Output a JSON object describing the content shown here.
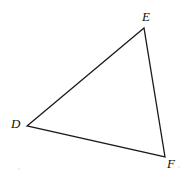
{
  "figure": {
    "kind": "geometry-diagram",
    "shape": "triangle",
    "name": "Triangle DEF",
    "canvas": {
      "width": 187,
      "height": 181
    },
    "background_color": "#ffffff",
    "stroke_color": "#1a1a1a",
    "stroke_width": 1.3,
    "fill": "none",
    "label_color": "#111111",
    "label_style": "italic-serif",
    "vertices": [
      {
        "id": "D",
        "label": "D",
        "x": 27,
        "y": 126,
        "label_x": 15,
        "label_y": 124,
        "label_position": "left"
      },
      {
        "id": "E",
        "label": "E",
        "x": 144,
        "y": 28,
        "label_x": 148,
        "label_y": 17,
        "label_position": "above-right"
      },
      {
        "id": "F",
        "label": "F",
        "x": 165,
        "y": 157,
        "label_x": 171,
        "label_y": 164,
        "label_position": "below-right"
      }
    ],
    "edges": [
      {
        "id": "DE",
        "from": "D",
        "to": "E"
      },
      {
        "id": "EF",
        "from": "E",
        "to": "F"
      },
      {
        "id": "FD",
        "from": "F",
        "to": "D"
      }
    ],
    "path_points": "27,126 144,28 165,157",
    "artifacts": [
      {
        "id": "speck-1",
        "x": 18,
        "y": 168,
        "size": 2
      },
      {
        "id": "speck-2",
        "x": 178,
        "y": 166,
        "size": 2
      }
    ]
  }
}
